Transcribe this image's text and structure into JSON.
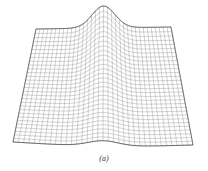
{
  "figure": {
    "caption": "(a)",
    "colors": {
      "mesh": "#9a9a9a",
      "edge": "#555555",
      "background": "#ffffff"
    },
    "mesh": {
      "rows": 30,
      "cols": 34,
      "corners": {
        "tl": [
          36,
          29
        ],
        "tr": [
          171,
          27
        ],
        "bl": [
          13,
          142
        ],
        "br": [
          193,
          145
        ]
      },
      "bump_height": 22,
      "bump_center": 0.5,
      "bump_width": 0.12
    }
  }
}
